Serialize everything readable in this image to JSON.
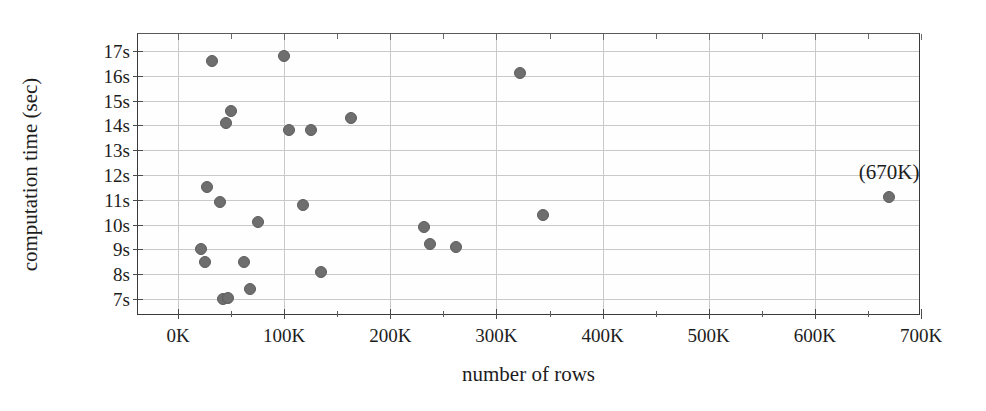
{
  "figure": {
    "title": "",
    "caption": ""
  },
  "chart_data": {
    "type": "scatter",
    "title": "",
    "xlabel": "number of rows",
    "ylabel": "computation time (sec)",
    "xlim": [
      0,
      700000
    ],
    "ylim": [
      6.4,
      17.6
    ],
    "grid": true,
    "legend": null,
    "x_tick_labels": [
      "0K",
      "100K",
      "200K",
      "300K",
      "400K",
      "500K",
      "600K",
      "700K"
    ],
    "x_tick_values": [
      0,
      100000,
      200000,
      300000,
      400000,
      500000,
      600000,
      700000
    ],
    "x_minor_tick_values": [
      50000,
      150000,
      250000,
      350000,
      450000,
      550000,
      650000
    ],
    "y_tick_labels": [
      "7s",
      "8s",
      "9s",
      "10s",
      "11s",
      "12s",
      "13s",
      "14s",
      "15s",
      "16s",
      "17s"
    ],
    "y_tick_values": [
      7,
      8,
      9,
      10,
      11,
      12,
      13,
      14,
      15,
      16,
      17
    ],
    "marker_color": "#6e6e6e",
    "grid_color": "#c9c9c9",
    "axis_color": "#3a3a3a",
    "series": [
      {
        "name": "computation time vs number of rows",
        "points": [
          {
            "x": 22000,
            "y": 9.0
          },
          {
            "x": 25000,
            "y": 8.5
          },
          {
            "x": 27000,
            "y": 11.5
          },
          {
            "x": 32000,
            "y": 16.6
          },
          {
            "x": 40000,
            "y": 10.9
          },
          {
            "x": 42000,
            "y": 7.0
          },
          {
            "x": 45000,
            "y": 14.1
          },
          {
            "x": 47000,
            "y": 7.05
          },
          {
            "x": 50000,
            "y": 14.6
          },
          {
            "x": 62000,
            "y": 8.5
          },
          {
            "x": 68000,
            "y": 7.4
          },
          {
            "x": 75000,
            "y": 10.1
          },
          {
            "x": 100000,
            "y": 16.8
          },
          {
            "x": 105000,
            "y": 13.8
          },
          {
            "x": 118000,
            "y": 10.8
          },
          {
            "x": 125000,
            "y": 13.8
          },
          {
            "x": 135000,
            "y": 8.1
          },
          {
            "x": 163000,
            "y": 14.3
          },
          {
            "x": 232000,
            "y": 9.9
          },
          {
            "x": 237000,
            "y": 9.2
          },
          {
            "x": 262000,
            "y": 9.1
          },
          {
            "x": 322000,
            "y": 16.1
          },
          {
            "x": 344000,
            "y": 10.4
          },
          {
            "x": 670000,
            "y": 11.1
          }
        ]
      }
    ],
    "annotations": [
      {
        "text": "(670K)",
        "x": 670000,
        "y": 11.1,
        "dy_px": 14
      }
    ]
  }
}
